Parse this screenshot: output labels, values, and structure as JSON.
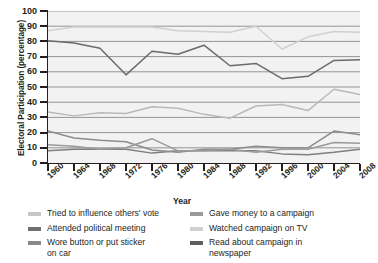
{
  "chart_data": {
    "type": "line",
    "title": "",
    "xlabel": "Year",
    "ylabel": "Electoral Participation (percentage)",
    "xlim": [
      1960,
      2008
    ],
    "ylim": [
      0,
      100
    ],
    "ytick_step": 10,
    "grid": true,
    "legend_position": "bottom",
    "categories": [
      1960,
      1964,
      1968,
      1972,
      1976,
      1980,
      1984,
      1988,
      1992,
      1996,
      2000,
      2004,
      2008
    ],
    "ytick_labels": [
      "0",
      "10",
      "20",
      "30",
      "40",
      "50",
      "60",
      "70",
      "80",
      "90",
      "100"
    ],
    "xtick_labels": [
      "1960",
      "1964",
      "1968",
      "1972",
      "1976",
      "1980",
      "1984",
      "1988",
      "1992",
      "1996",
      "2000",
      "2004",
      "2008"
    ],
    "series": [
      {
        "name": "Tried to influence others' vote",
        "color": "#b9b9b9",
        "values": [
          33.5,
          31,
          33,
          32.5,
          37,
          36,
          32,
          29.5,
          37.5,
          38.5,
          34.5,
          48.5,
          45
        ]
      },
      {
        "name": "Attended political meeting",
        "color": "#7f7f7f",
        "values": [
          8,
          9,
          9,
          9,
          6.5,
          8,
          8,
          8,
          8,
          6,
          5.5,
          7,
          9
        ]
      },
      {
        "name": "Wore button or put sticker on car",
        "color": "#8c8c8c",
        "values": [
          21,
          16.5,
          15,
          14,
          8.5,
          7,
          9,
          9,
          11,
          10,
          10,
          21,
          18.5
        ]
      },
      {
        "name": "Gave money to a campaign",
        "color": "#9a9a9a",
        "values": [
          12,
          11,
          9,
          10,
          16,
          8,
          8,
          9,
          7,
          9,
          9,
          13.5,
          13
        ]
      },
      {
        "name": "Watched campaign on TV",
        "color": "#d0d0d0",
        "values": [
          87,
          89.5,
          89.5,
          89.5,
          89.5,
          87,
          86.5,
          86,
          90,
          75,
          83,
          86.5,
          86
        ]
      },
      {
        "name": "Read about campaign in newspaper",
        "color": "#6b6b6b",
        "values": [
          80.5,
          79,
          75.5,
          58,
          73.5,
          71.5,
          77.5,
          64,
          65.5,
          55.5,
          57,
          67.5,
          68
        ]
      }
    ]
  },
  "legend": {
    "left_column": [
      {
        "label": "Tried to influence others' vote",
        "label2": "",
        "color": "#c6c6c6"
      },
      {
        "label": "Attended political meeting",
        "label2": "",
        "color": "#6f6f6f"
      },
      {
        "label": "Wore button or put sticker",
        "label2": "on car",
        "color": "#8a8a8a"
      }
    ],
    "right_column": [
      {
        "label": "Gave money to a campaign",
        "label2": "",
        "color": "#9a9a9a"
      },
      {
        "label": "Watched campaign on TV",
        "label2": "",
        "color": "#cfcfcf"
      },
      {
        "label": "Read about campaign in",
        "label2": "newspaper",
        "color": "#5f5f5f"
      }
    ]
  }
}
